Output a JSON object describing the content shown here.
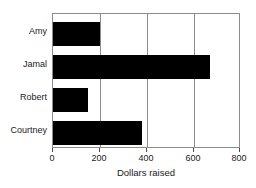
{
  "chart_data": {
    "type": "bar",
    "orientation": "horizontal",
    "title": "",
    "subtitle": "",
    "xlabel": "Dollars raised",
    "ylabel": "",
    "categories": [
      "Amy",
      "Jamal",
      "Robert",
      "Courtney"
    ],
    "values": [
      200,
      670,
      150,
      380
    ],
    "series": [
      {
        "name": "Dollars raised",
        "values": [
          200,
          670,
          150,
          380
        ]
      }
    ],
    "xlim": [
      0,
      800
    ],
    "xticks": [
      0,
      200,
      400,
      600,
      800
    ],
    "xtick_labels": [
      "0",
      "200",
      "400",
      "600",
      "800"
    ],
    "grid": true,
    "grid_axis": "x",
    "legend": false,
    "legend_position": "none",
    "annotations": [],
    "bar_color": "#000000",
    "frame_color": "#8c8c8c",
    "background_color": "#ffffff"
  },
  "bars": [
    {
      "label": "Amy",
      "value": 200
    },
    {
      "label": "Jamal",
      "value": 670
    },
    {
      "label": "Robert",
      "value": 150
    },
    {
      "label": "Courtney",
      "value": 380
    }
  ],
  "axis": {
    "x_title": "Dollars raised",
    "ticks": [
      "0",
      "200",
      "400",
      "600",
      "800"
    ]
  }
}
